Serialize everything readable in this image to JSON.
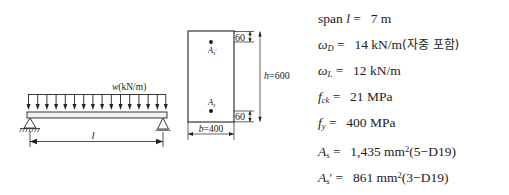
{
  "figure": {
    "title_absent": true,
    "beam_diagram": {
      "load_label": "w(kN/m)",
      "load_label_parts": {
        "symbol": "w",
        "units": "(kN/m)"
      },
      "span_label": "l",
      "arrow_count": 16,
      "left_support_type": "pinned-hatched",
      "right_support_type": "roller-triangle",
      "dimension_label": "l"
    },
    "cross_section": {
      "top_rebar_label": "A",
      "top_rebar_sub": "s",
      "top_rebar_prime": "′",
      "bottom_rebar_label": "A",
      "bottom_rebar_sub": "s",
      "width_label": "b=400",
      "width_label_parts": {
        "symbol": "b",
        "eq": "=",
        "value": "400"
      },
      "height_label": "h=600",
      "height_label_parts": {
        "symbol": "h",
        "eq": "=",
        "value": "600"
      },
      "top_cover": "60",
      "bottom_cover": "60"
    }
  },
  "given_data": {
    "lines": [
      {
        "id": "span",
        "prefix": "span",
        "symbol": "l",
        "sub": "",
        "prime": "",
        "eq": "=",
        "value": "7",
        "unit": "m",
        "note": "",
        "paren": ""
      },
      {
        "id": "omega-D",
        "prefix": "",
        "symbol": "ω",
        "sub": "D",
        "prime": "",
        "eq": "=",
        "value": "14",
        "unit": "kN/m",
        "note": "자중 포함",
        "paren": "(자중 포함)"
      },
      {
        "id": "omega-L",
        "prefix": "",
        "symbol": "ω",
        "sub": "L",
        "prime": "",
        "eq": "=",
        "value": "12",
        "unit": "kN/m",
        "note": "",
        "paren": ""
      },
      {
        "id": "f-ck",
        "prefix": "",
        "symbol": "f",
        "sub": "ck",
        "prime": "",
        "eq": "=",
        "value": "21",
        "unit": "MPa",
        "note": "",
        "paren": ""
      },
      {
        "id": "f-y",
        "prefix": "",
        "symbol": "f",
        "sub": "y",
        "prime": "",
        "eq": "=",
        "value": "400",
        "unit": "MPa",
        "note": "",
        "paren": ""
      },
      {
        "id": "A-s",
        "prefix": "",
        "symbol": "A",
        "sub": "s",
        "prime": "",
        "eq": "=",
        "value": "1,435",
        "unit": "mm",
        "unit_sup": "2",
        "note": "5−D19",
        "paren": "(5−D19)"
      },
      {
        "id": "A-s-prime",
        "prefix": "",
        "symbol": "A",
        "sub": "s",
        "prime": "′",
        "eq": "=",
        "value": "861",
        "unit": "mm",
        "unit_sup": "2",
        "note": "3−D19",
        "paren": "(3−D19)"
      }
    ]
  },
  "colors": {
    "line": "#222222",
    "text": "#1a1a1a",
    "background": "#ffffff",
    "beam_fill": "#f2f2f2"
  }
}
